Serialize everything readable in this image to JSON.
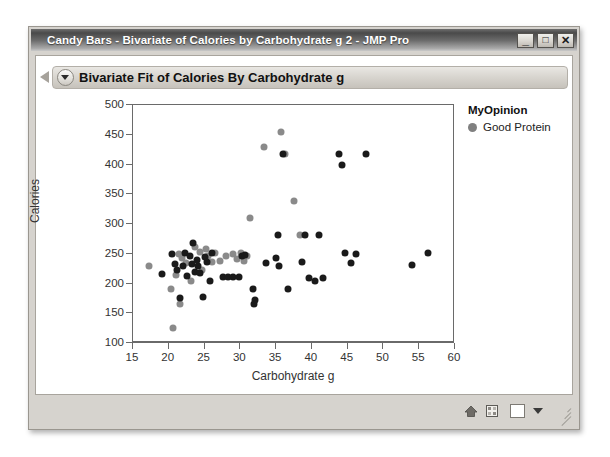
{
  "window": {
    "title": "Candy Bars - Bivariate of Calories by Carbohydrate g 2 - JMP Pro",
    "minimize_label": "_",
    "maximize_label": "□",
    "close_label": "✕"
  },
  "report": {
    "header_title": "Bivariate Fit of Calories By Carbohydrate g",
    "outline_icon": "outline-triangle-icon",
    "disclosure_icon": "chevron-down-icon"
  },
  "legend": {
    "title": "MyOpinion",
    "entries": [
      {
        "label": "Good Protein",
        "color": "#808080",
        "marker": "circle"
      }
    ]
  },
  "statusbar": {
    "home_icon": "home-icon",
    "grid_icon": "grid-icon",
    "swatch_label": "",
    "caret_icon": "caret-down-icon",
    "grip_icon": "resize-grip-icon"
  },
  "colors": {
    "marker_dark": "#1a1a1a",
    "marker_gray": "#8a8a8a",
    "axis": "#6a6a6a",
    "titlebar_text": "#ffffff"
  },
  "chart_data": {
    "type": "scatter",
    "title": "Bivariate Fit of Calories By Carbohydrate g",
    "xlabel": "Carbohydrate g",
    "ylabel": "Calories",
    "xlim": [
      15,
      60
    ],
    "ylim": [
      100,
      500
    ],
    "xticks": [
      15,
      20,
      25,
      30,
      35,
      40,
      45,
      50,
      55,
      60
    ],
    "yticks": [
      100,
      150,
      200,
      250,
      300,
      350,
      400,
      450,
      500
    ],
    "grid": false,
    "legend_position": "right",
    "legend_title": "MyOpinion",
    "series": [
      {
        "name": "Good Protein",
        "color": "#8a8a8a",
        "points": [
          [
            17.2,
            230
          ],
          [
            20.3,
            190
          ],
          [
            20.6,
            126
          ],
          [
            21.0,
            215
          ],
          [
            21.4,
            250
          ],
          [
            21.5,
            166
          ],
          [
            21.8,
            243
          ],
          [
            22.4,
            235
          ],
          [
            23.1,
            205
          ],
          [
            23.6,
            262
          ],
          [
            24.3,
            253
          ],
          [
            24.6,
            222
          ],
          [
            25.2,
            258
          ],
          [
            25.5,
            246
          ],
          [
            26.1,
            236
          ],
          [
            26.4,
            251
          ],
          [
            27.2,
            237
          ],
          [
            28.0,
            247
          ],
          [
            29.0,
            249
          ],
          [
            29.6,
            241
          ],
          [
            30.1,
            251
          ],
          [
            30.5,
            238
          ],
          [
            31.0,
            246
          ],
          [
            31.4,
            310
          ],
          [
            33.3,
            430
          ],
          [
            35.7,
            454
          ],
          [
            36.2,
            417
          ],
          [
            37.5,
            338
          ],
          [
            38.4,
            281
          ]
        ]
      },
      {
        "name": "Other",
        "color": "#1a1a1a",
        "points": [
          [
            19.0,
            216
          ],
          [
            20.4,
            249
          ],
          [
            20.8,
            233
          ],
          [
            21.2,
            222
          ],
          [
            21.6,
            175
          ],
          [
            22.0,
            229
          ],
          [
            22.3,
            251
          ],
          [
            22.6,
            213
          ],
          [
            22.9,
            246
          ],
          [
            23.2,
            233
          ],
          [
            23.4,
            268
          ],
          [
            23.7,
            220
          ],
          [
            23.9,
            240
          ],
          [
            24.1,
            230
          ],
          [
            24.4,
            218
          ],
          [
            24.8,
            178
          ],
          [
            25.0,
            244
          ],
          [
            25.3,
            236
          ],
          [
            25.7,
            205
          ],
          [
            26.0,
            252
          ],
          [
            27.6,
            211
          ],
          [
            28.3,
            211
          ],
          [
            29.0,
            211
          ],
          [
            29.8,
            211
          ],
          [
            30.2,
            247
          ],
          [
            30.6,
            248
          ],
          [
            31.8,
            190
          ],
          [
            31.9,
            165
          ],
          [
            32.0,
            172
          ],
          [
            33.6,
            234
          ],
          [
            35.0,
            243
          ],
          [
            35.2,
            281
          ],
          [
            35.4,
            229
          ],
          [
            36.0,
            417
          ],
          [
            36.6,
            190
          ],
          [
            38.6,
            236
          ],
          [
            39.0,
            281
          ],
          [
            39.6,
            209
          ],
          [
            40.4,
            205
          ],
          [
            41.0,
            281
          ],
          [
            41.6,
            209
          ],
          [
            43.8,
            417
          ],
          [
            44.2,
            399
          ],
          [
            44.6,
            252
          ],
          [
            45.4,
            234
          ],
          [
            46.2,
            249
          ],
          [
            47.6,
            417
          ],
          [
            54.0,
            231
          ],
          [
            56.2,
            252
          ]
        ]
      }
    ]
  }
}
